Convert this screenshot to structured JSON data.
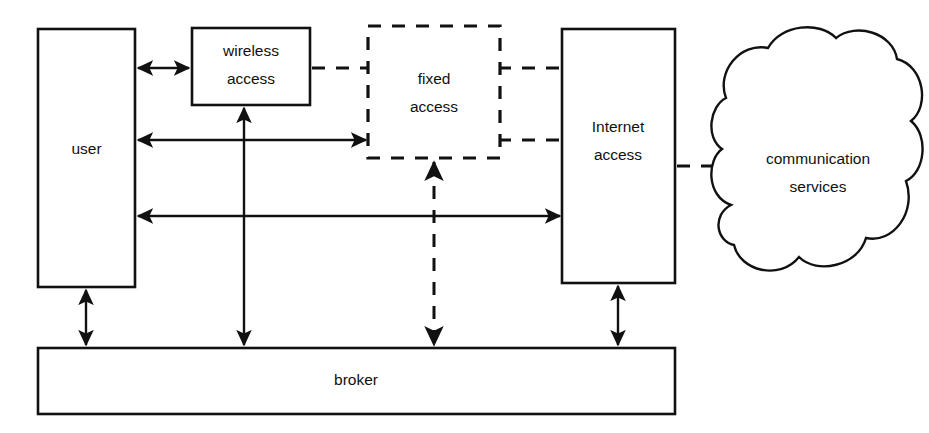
{
  "diagram": {
    "canvas": {
      "width": 929,
      "height": 433
    },
    "style": {
      "background": "#ffffff",
      "stroke": "#111111",
      "fill": "#ffffff"
    },
    "nodes": [
      {
        "id": "user",
        "label": "user",
        "shape": "rectangle",
        "border": "solid",
        "x": 38,
        "y": 29,
        "w": 97,
        "h": 258
      },
      {
        "id": "wireless-access",
        "label": "wireless\naccess",
        "line1": "wireless",
        "line2": "access",
        "shape": "rectangle",
        "border": "solid",
        "x": 192,
        "y": 28,
        "w": 118,
        "h": 77
      },
      {
        "id": "fixed-access",
        "label": "fixed\naccess",
        "line1": "fixed",
        "line2": "access",
        "shape": "rectangle",
        "border": "dashed",
        "x": 368,
        "y": 26,
        "w": 132,
        "h": 132
      },
      {
        "id": "internet-access",
        "label": "Internet\naccess",
        "line1": "Internet",
        "line2": "access",
        "shape": "rectangle",
        "border": "solid",
        "x": 562,
        "y": 29,
        "w": 113,
        "h": 254
      },
      {
        "id": "communication-services",
        "label": "communication\nservices",
        "line1": "communication",
        "line2": "services",
        "shape": "cloud",
        "border": "solid",
        "x": 710,
        "y": 25,
        "w": 215,
        "h": 265
      },
      {
        "id": "broker",
        "label": "broker",
        "shape": "rectangle",
        "border": "solid",
        "x": 38,
        "y": 348,
        "w": 637,
        "h": 66
      }
    ],
    "connections": [
      {
        "id": "user-wireless",
        "from": "user",
        "to": "wireless-access",
        "style": "solid",
        "arrows": "both",
        "orientation": "horizontal"
      },
      {
        "id": "user-fixed",
        "from": "user",
        "to": "fixed-access",
        "style": "solid",
        "arrows": "both",
        "orientation": "horizontal"
      },
      {
        "id": "user-internet",
        "from": "user",
        "to": "internet-access",
        "style": "solid",
        "arrows": "both",
        "orientation": "horizontal"
      },
      {
        "id": "wireless-fixed",
        "from": "wireless-access",
        "to": "fixed-access",
        "style": "dashed",
        "arrows": "none",
        "orientation": "horizontal"
      },
      {
        "id": "fixed-internet-top",
        "from": "fixed-access",
        "to": "internet-access",
        "style": "dashed",
        "arrows": "none",
        "orientation": "horizontal"
      },
      {
        "id": "fixed-internet-bot",
        "from": "fixed-access",
        "to": "internet-access",
        "style": "dashed",
        "arrows": "none",
        "orientation": "horizontal"
      },
      {
        "id": "internet-cloud",
        "from": "internet-access",
        "to": "communication-services",
        "style": "dashed",
        "arrows": "none",
        "orientation": "horizontal"
      },
      {
        "id": "user-broker",
        "from": "user",
        "to": "broker",
        "style": "solid",
        "arrows": "both",
        "orientation": "vertical"
      },
      {
        "id": "wireless-broker",
        "from": "wireless-access",
        "to": "broker",
        "style": "solid",
        "arrows": "both",
        "orientation": "vertical"
      },
      {
        "id": "fixed-broker",
        "from": "fixed-access",
        "to": "broker",
        "style": "dashed",
        "arrows": "both",
        "orientation": "vertical"
      },
      {
        "id": "internet-broker",
        "from": "internet-access",
        "to": "broker",
        "style": "solid",
        "arrows": "both",
        "orientation": "vertical"
      }
    ]
  }
}
